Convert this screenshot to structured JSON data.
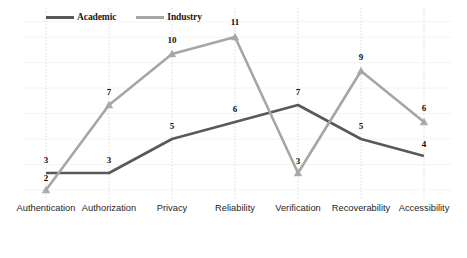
{
  "legend": {
    "position": "top-left-inside",
    "entries": [
      {
        "label": "Academic",
        "color": "#595959",
        "icon": "line-swatch"
      },
      {
        "label": "Industry",
        "color": "#a6a6a6",
        "icon": "line-swatch"
      }
    ]
  },
  "axis": {
    "tick_labels": [
      "Authentication",
      "Authorization",
      "Privacy",
      "Reliability",
      "Verification",
      "Recoverability",
      "Accessibility"
    ]
  },
  "caption": {
    "text": ""
  },
  "chart_data": {
    "type": "line",
    "title": "",
    "subtitle": "",
    "xlabel": "",
    "ylabel": "",
    "categories": [
      "Authentication",
      "Authorization",
      "Privacy",
      "Reliability",
      "Verification",
      "Recoverability",
      "Accessibility"
    ],
    "series": [
      {
        "name": "Academic",
        "color": "#595959",
        "values": [
          3,
          3,
          5,
          6,
          7,
          5,
          4
        ],
        "marker": "none"
      },
      {
        "name": "Industry",
        "color": "#a6a6a6",
        "values": [
          2,
          7,
          10,
          11,
          3,
          9,
          6
        ],
        "marker": "triangle-up"
      }
    ],
    "data_labels": [
      {
        "category": "Authentication",
        "series": "Academic",
        "value": 3,
        "text": "3"
      },
      {
        "category": "Authentication",
        "series": "Industry",
        "value": 2,
        "text": "2"
      },
      {
        "category": "Authorization",
        "series": "Industry",
        "value": 7,
        "text": "7"
      },
      {
        "category": "Authorization",
        "series": "Academic",
        "value": 3,
        "text": "3"
      },
      {
        "category": "Privacy",
        "series": "Industry",
        "value": 10,
        "text": "10"
      },
      {
        "category": "Privacy",
        "series": "Academic",
        "value": 5,
        "text": "5"
      },
      {
        "category": "Reliability",
        "series": "Industry",
        "value": 11,
        "text": "11"
      },
      {
        "category": "Reliability",
        "series": "Academic",
        "value": 6,
        "text": "6"
      },
      {
        "category": "Verification",
        "series": "Academic",
        "value": 7,
        "text": "7"
      },
      {
        "category": "Verification",
        "series": "Industry",
        "value": 3,
        "text": "3"
      },
      {
        "category": "Recoverability",
        "series": "Industry",
        "value": 9,
        "text": "9"
      },
      {
        "category": "Recoverability",
        "series": "Academic",
        "value": 5,
        "text": "5"
      },
      {
        "category": "Accessibility",
        "series": "Industry",
        "value": 6,
        "text": "6"
      },
      {
        "category": "Accessibility",
        "series": "Academic",
        "value": 4,
        "text": "4"
      }
    ],
    "ylim": [
      0,
      12
    ],
    "grid": true,
    "gridlines": "horizontal-light",
    "droplines": "dotted-vertical-at-each-category",
    "legend": "top-left"
  }
}
